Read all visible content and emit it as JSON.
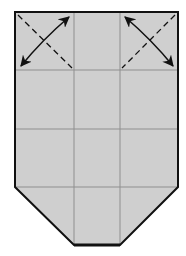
{
  "diagram": {
    "type": "origami-fold-step",
    "colors": {
      "paper": "#cfcfcf",
      "outline": "#111111",
      "crease": "#8a8a8a",
      "arrow": "#111111",
      "background": "#ffffff"
    },
    "shape": {
      "description": "Paper rectangle with bottom corners folded in, divided into a 3x4 crease grid",
      "outline_points": [
        [
          15,
          12
        ],
        [
          178,
          12
        ],
        [
          178,
          187
        ],
        [
          120,
          245
        ],
        [
          74,
          245
        ],
        [
          15,
          187
        ]
      ]
    },
    "creases": {
      "vertical_x": [
        74,
        120
      ],
      "horizontal_y": [
        70,
        129,
        187
      ]
    },
    "fold_guides": [
      {
        "name": "top-left-valley-fold",
        "style": "dashed",
        "from": [
          18,
          15
        ],
        "to": [
          72,
          68
        ]
      },
      {
        "name": "top-right-valley-fold",
        "style": "dashed",
        "from": [
          175,
          15
        ],
        "to": [
          122,
          68
        ]
      }
    ],
    "arrows": [
      {
        "name": "top-left-fold-arrow",
        "from": [
          20,
          66
        ],
        "to": [
          70,
          16
        ],
        "double_headed": true
      },
      {
        "name": "top-right-fold-arrow",
        "from": [
          124,
          16
        ],
        "to": [
          174,
          66
        ],
        "double_headed": true
      }
    ]
  }
}
